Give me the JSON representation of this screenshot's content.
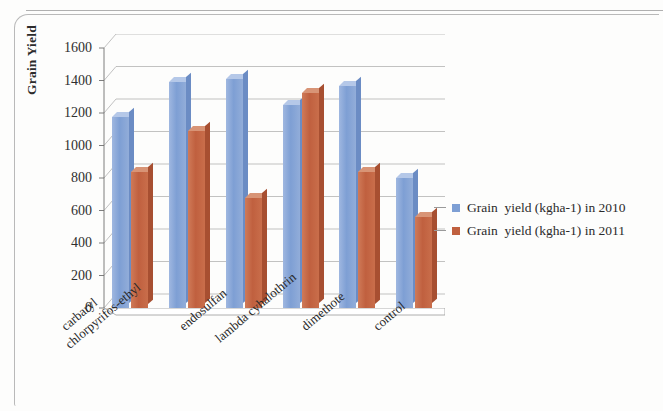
{
  "chart_data": {
    "type": "bar",
    "title": "",
    "xlabel": "",
    "ylabel": "Grain Yield",
    "ylim": [
      0,
      1600
    ],
    "yticks": [
      1600,
      1400,
      1200,
      1000,
      800,
      600,
      400,
      200,
      0
    ],
    "grid": true,
    "legend_position": "right",
    "categories": [
      "carbaryl",
      "chlorpyrifos-ethyl",
      "endosulfan",
      "lambda cyhalothrin",
      "dimethote",
      "control"
    ],
    "series": [
      {
        "name": "Grain  yield (kgha-1) in 2010",
        "color": "#7e9fd4",
        "values": [
          1175,
          1390,
          1410,
          1250,
          1365,
          800
        ]
      },
      {
        "name": "Grain  yield (kgha-1) in 2011",
        "color": "#c0603f",
        "values": [
          840,
          1090,
          680,
          1325,
          840,
          560
        ]
      }
    ]
  },
  "axis": {
    "y_title": "Grain Yield"
  },
  "legend": {
    "items": [
      {
        "label": "Grain  yield (kgha-1) in 2010",
        "swatch": "#7e9fd4"
      },
      {
        "label": "Grain  yield (kgha-1) in 2011",
        "swatch": "#c0603f"
      }
    ]
  }
}
